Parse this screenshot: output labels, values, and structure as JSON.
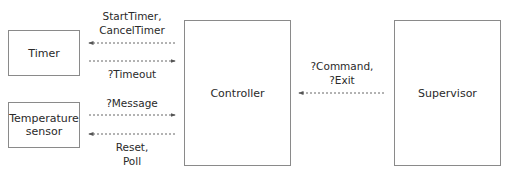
{
  "nodes": {
    "timer": "Timer",
    "temperature_sensor": "Temperature\nsensor",
    "controller": "Controller",
    "supervisor": "Supervisor"
  },
  "edges": {
    "controller_to_timer": "StartTimer,\nCancelTimer",
    "timer_to_controller": "?Timeout",
    "sensor_to_controller": "?Message",
    "controller_to_sensor": "Reset,\nPoll",
    "supervisor_to_controller": "?Command,\n?Exit"
  },
  "colors": {
    "border": "#8a8a8a",
    "arrow": "#555555",
    "text": "#2a2a2a"
  }
}
